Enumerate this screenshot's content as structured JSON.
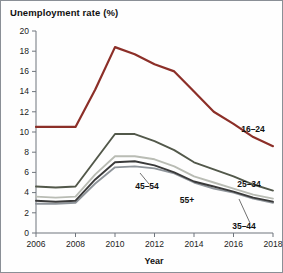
{
  "chart_data": {
    "type": "line",
    "title": "Unemployment rate (%)",
    "xlabel": "Year",
    "ylabel": "",
    "xlim": [
      2006,
      2018
    ],
    "ylim": [
      0,
      20
    ],
    "grid": false,
    "legend_position": "inline-labels",
    "xticks": [
      "2006",
      "2008",
      "2010",
      "2012",
      "2014",
      "2016",
      "2018"
    ],
    "yticks": [
      "0",
      "2",
      "4",
      "6",
      "8",
      "10",
      "12",
      "14",
      "16",
      "18",
      "20"
    ],
    "x": [
      2006,
      2007,
      2008,
      2009,
      2010,
      2011,
      2012,
      2013,
      2014,
      2015,
      2016,
      2017,
      2018
    ],
    "series": [
      {
        "name": "16-24",
        "color": "#8c2f28",
        "values": [
          10.5,
          10.5,
          10.5,
          14.2,
          18.4,
          17.7,
          16.7,
          16.0,
          14.0,
          12.0,
          10.8,
          9.5,
          8.6
        ]
      },
      {
        "name": "25-34",
        "color": "#52584a",
        "values": [
          4.6,
          4.5,
          4.6,
          7.2,
          9.8,
          9.8,
          9.1,
          8.2,
          7.0,
          6.3,
          5.6,
          4.8,
          4.2
        ]
      },
      {
        "name": "35-44",
        "color": "#b9bcb4",
        "values": [
          3.6,
          3.5,
          3.6,
          5.8,
          7.6,
          7.6,
          7.3,
          6.6,
          5.6,
          5.0,
          4.4,
          3.8,
          3.4
        ]
      },
      {
        "name": "45-54",
        "color": "#3a3a3a",
        "values": [
          3.2,
          3.1,
          3.2,
          5.3,
          7.0,
          7.1,
          6.7,
          6.0,
          5.1,
          4.6,
          4.1,
          3.5,
          3.1
        ]
      },
      {
        "name": "55+",
        "color": "#8e949a",
        "values": [
          2.9,
          2.9,
          3.0,
          4.9,
          6.5,
          6.6,
          6.4,
          5.9,
          5.0,
          4.4,
          4.0,
          3.4,
          3.0
        ]
      }
    ],
    "annotations": [
      {
        "label": "16-24",
        "x": 252,
        "y": 131
      },
      {
        "label": "25-34",
        "x": 248,
        "y": 186
      },
      {
        "label": "35-44",
        "x": 243,
        "y": 228
      },
      {
        "label": "45-54",
        "x": 146,
        "y": 188
      },
      {
        "label": "55+",
        "x": 186,
        "y": 202
      }
    ]
  },
  "chart": {
    "title": "Unemployment rate (%)",
    "xlabel": "Year"
  }
}
